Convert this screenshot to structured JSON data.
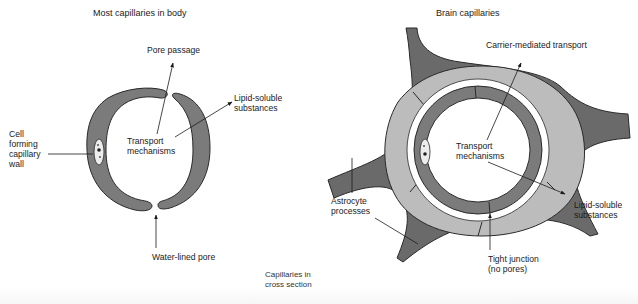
{
  "diagram": {
    "caption": "Capillaries in\ncross section",
    "colors": {
      "endothelium": "#7b7b7b",
      "astrocyte_dark": "#6a6a6a",
      "astrocyte_light": "#bcbcbc",
      "outline": "#2a2a2a",
      "background": "#ffffff"
    },
    "left_panel": {
      "title": "Most capillaries in body",
      "labels": {
        "pore_passage": "Pore passage",
        "lipid_soluble": "Lipid-soluble\nsubstances",
        "cell_forming": "Cell\nforming\ncapillary\nwall",
        "transport": "Transport\nmechanisms",
        "water_pore": "Water-lined pore"
      }
    },
    "right_panel": {
      "title": "Brain capillaries",
      "labels": {
        "carrier": "Carrier-mediated transport",
        "transport": "Transport\nmechanisms",
        "astrocyte": "Astrocyte\nprocesses",
        "lipid_soluble": "Lipid-soluble\nsubstances",
        "tight_junction": "Tight junction\n(no pores)"
      }
    }
  }
}
